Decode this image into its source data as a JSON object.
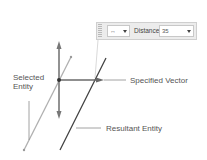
{
  "toolbar": {
    "direction_icon": "double-arrow-icon",
    "direction_glyph": "↔",
    "distance_label": "Distance",
    "distance_value": "35"
  },
  "labels": {
    "selected_entity_line1": "Selected",
    "selected_entity_line2": "Entity",
    "specified_vector": "Specified Vector",
    "resultant_entity": "Resultant Entity"
  },
  "colors": {
    "selected_entity": "#b0b0b0",
    "resultant_entity": "#404040",
    "vector": "#6a6a6a",
    "leader": "#8a8a8a"
  }
}
